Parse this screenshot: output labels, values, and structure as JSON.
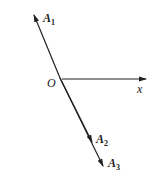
{
  "figure": {
    "labels": {
      "a1": "A",
      "a1_sub": "1",
      "a2": "A",
      "a2_sub": "2",
      "a3": "A",
      "a3_sub": "3",
      "origin": "O",
      "x_axis": "x"
    },
    "color": "#222222"
  }
}
